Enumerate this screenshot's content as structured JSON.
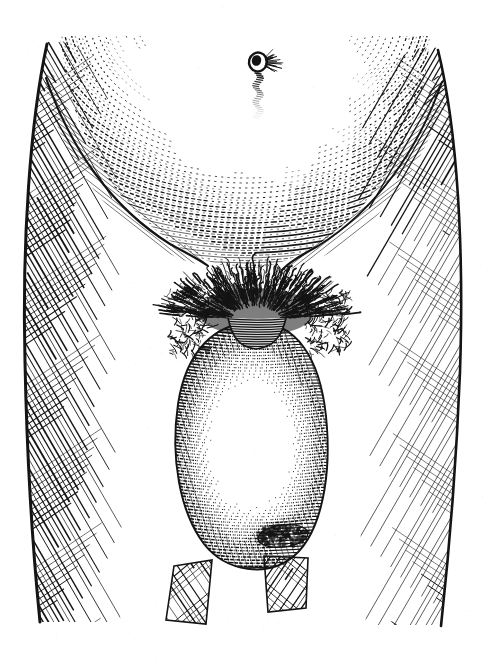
{
  "figure": {
    "kind": "vintage-engraving-illustration",
    "subject": "male lower abdomen and groin with enlarged scrotal mass",
    "technique": "line engraving with cross-hatching",
    "caption": "",
    "title": "",
    "signature": "",
    "border": "none",
    "background_color": "#ffffff",
    "ink_color": "#1a1a1a",
    "canvas": {
      "width": 487,
      "height": 662
    }
  },
  "palette": {
    "paper": "#ffffff",
    "ink": "#141414",
    "ink_mid": "#3a3a3a",
    "ink_light": "#777777",
    "highlight": "#ffffff"
  },
  "regions": [
    {
      "name": "left-thigh",
      "label": "Left thigh",
      "hatch_angle_deg": 58,
      "tone": 0.52,
      "bbox": [
        18,
        60,
        150,
        620
      ]
    },
    {
      "name": "right-thigh",
      "label": "Right thigh",
      "hatch_angle_deg": -58,
      "tone": 0.46,
      "bbox": [
        330,
        60,
        470,
        620
      ]
    },
    {
      "name": "lower-abdomen",
      "label": "Lower abdomen",
      "hatch_angle_deg": 0,
      "tone": 0.3,
      "bbox": [
        60,
        40,
        430,
        270
      ]
    },
    {
      "name": "left-inguinal-fold",
      "label": "Left inguinal fold",
      "hatch_angle_deg": 40,
      "tone": 0.68,
      "bbox": [
        35,
        95,
        210,
        260
      ]
    },
    {
      "name": "right-inguinal-fold",
      "label": "Right inguinal fold",
      "hatch_angle_deg": -40,
      "tone": 0.62,
      "bbox": [
        280,
        95,
        455,
        270
      ]
    },
    {
      "name": "pubic-hair",
      "label": "Pubic hair tuft",
      "hatch_angle_deg": 0,
      "tone": 0.92,
      "bbox": [
        195,
        262,
        315,
        335
      ]
    },
    {
      "name": "scrotal-mass",
      "label": "Enlarged scrotal mass",
      "hatch_angle_deg": 4,
      "tone": 0.34,
      "bbox": [
        175,
        325,
        330,
        570
      ]
    },
    {
      "name": "lesion",
      "label": "Dark surface lesion",
      "hatch_angle_deg": 0,
      "tone": 0.88,
      "bbox": [
        250,
        518,
        315,
        556
      ]
    },
    {
      "name": "left-inner-thigh-stub",
      "label": "Left inner thigh",
      "hatch_angle_deg": 55,
      "tone": 0.7,
      "bbox": [
        168,
        565,
        215,
        625
      ]
    },
    {
      "name": "right-inner-thigh-stub",
      "label": "Right inner thigh",
      "hatch_angle_deg": -55,
      "tone": 0.7,
      "bbox": [
        262,
        560,
        312,
        612
      ]
    }
  ],
  "details": {
    "navel": {
      "label": "Navel",
      "center": [
        258,
        62
      ],
      "radius": 9,
      "trail_length": 45
    },
    "midline_raphe": {
      "label": "Midline raphe",
      "from": [
        258,
        300
      ],
      "to": [
        258,
        345
      ]
    },
    "central_highlight": {
      "label": "Scrotal highlight",
      "center": [
        252,
        445
      ],
      "radius": 60
    }
  },
  "contours": {
    "left_thigh_outer": "dark bold outline along left body edge",
    "right_thigh_outer": "dark bold outline along right body edge",
    "mass_outline": "dark ovoid outline around scrotal mass"
  }
}
